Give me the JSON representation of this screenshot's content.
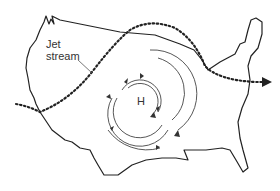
{
  "diagram": {
    "labels": {
      "jet_stream_line1": "Jet",
      "jet_stream_line2": "stream",
      "high_pressure": "H"
    },
    "colors": {
      "outline": "#222222",
      "jet_stream": "#222222",
      "circulation": "#444444",
      "background": "#ffffff"
    }
  }
}
